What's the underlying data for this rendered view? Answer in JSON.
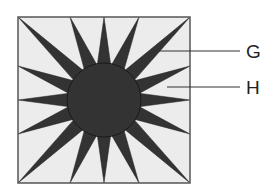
{
  "diagram": {
    "colors": {
      "background": "#ececec",
      "shape_fill": "#333333",
      "border": "#555555",
      "pointer_line": "#333333",
      "label": "#222222"
    },
    "square": {
      "x": 18,
      "y": 17,
      "width": 172,
      "height": 166
    },
    "center_circle": {
      "cx": 104,
      "cy": 100,
      "r": 37
    },
    "rays": {
      "count": 16,
      "base_half_width": 7,
      "base_radius": 33,
      "tips": [
        [
          18,
          17
        ],
        [
          70,
          17
        ],
        [
          104,
          17
        ],
        [
          139,
          17
        ],
        [
          190,
          17
        ],
        [
          190,
          66
        ],
        [
          190,
          100
        ],
        [
          190,
          134
        ],
        [
          190,
          183
        ],
        [
          139,
          183
        ],
        [
          104,
          183
        ],
        [
          70,
          183
        ],
        [
          18,
          183
        ],
        [
          18,
          134
        ],
        [
          18,
          100
        ],
        [
          18,
          66
        ]
      ]
    },
    "labels": [
      {
        "id": "G",
        "text": "G",
        "line": [
          152,
          51,
          240,
          51
        ],
        "text_x": 246,
        "text_y": 58,
        "points_to": "dark ray"
      },
      {
        "id": "H",
        "text": "H",
        "line": [
          167,
          87,
          240,
          87
        ],
        "text_x": 246,
        "text_y": 94,
        "points_to": "light background between rays"
      }
    ]
  }
}
